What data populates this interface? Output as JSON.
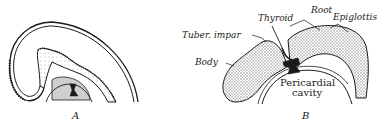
{
  "figure": {
    "panels": [
      {
        "id": "A",
        "label": "A"
      },
      {
        "id": "B",
        "label": "B"
      }
    ],
    "labels": {
      "thyroid": "Thyroid",
      "root": "Root",
      "epiglottis": "Epiglottis",
      "tuber_impar": "Tuber. impar",
      "body": "Body",
      "pericardial_line1": "Pericardial",
      "pericardial_line2": "cavity"
    },
    "colors": {
      "ink": "#1a1a1a",
      "stipple": "#c8c8c8",
      "background": "#ffffff"
    }
  }
}
